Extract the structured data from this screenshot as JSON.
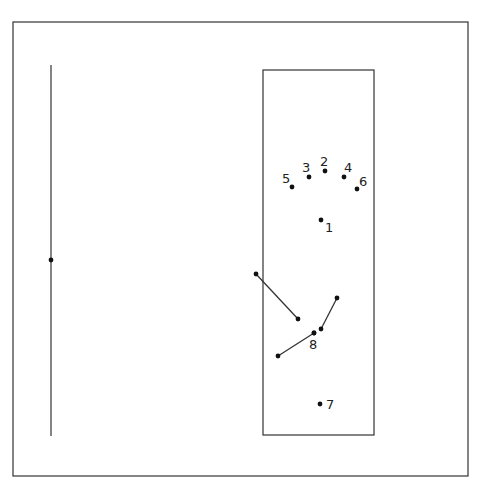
{
  "diagram": {
    "colors": {
      "stroke": "#333333",
      "dot": "#111111",
      "background": "#ffffff"
    },
    "outer_frame": {
      "x": 13,
      "y": 22,
      "w": 455,
      "h": 454
    },
    "left_axis": {
      "x": 51,
      "y1": 65,
      "y2": 436,
      "marker_y": 260
    },
    "inner_box": {
      "x": 263,
      "y": 70,
      "w": 111,
      "h": 365
    },
    "points": [
      {
        "label": "1",
        "x": 321,
        "y": 220,
        "lx": 325,
        "ly": 232
      },
      {
        "label": "2",
        "x": 325,
        "y": 171,
        "lx": 320,
        "ly": 166
      },
      {
        "label": "3",
        "x": 309,
        "y": 177,
        "lx": 302,
        "ly": 172
      },
      {
        "label": "4",
        "x": 344,
        "y": 177,
        "lx": 344,
        "ly": 172
      },
      {
        "label": "5",
        "x": 292,
        "y": 187,
        "lx": 282,
        "ly": 183
      },
      {
        "label": "6",
        "x": 357,
        "y": 189,
        "lx": 359,
        "ly": 186
      },
      {
        "label": "7",
        "x": 320,
        "y": 404,
        "lx": 326,
        "ly": 409
      },
      {
        "label": "8",
        "x": 314,
        "y": 333,
        "lx": 309,
        "ly": 349
      }
    ],
    "segments": [
      {
        "x1": 256,
        "y1": 274,
        "x2": 298,
        "y2": 319
      },
      {
        "x1": 337,
        "y1": 298,
        "x2": 321,
        "y2": 329
      },
      {
        "x1": 278,
        "y1": 356,
        "x2": 314,
        "y2": 333
      }
    ]
  }
}
